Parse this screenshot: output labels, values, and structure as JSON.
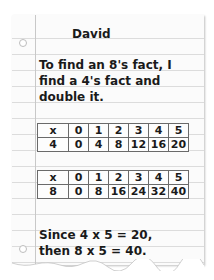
{
  "name": "David",
  "intro": "To find an 8's fact, I find a 4's fact and double it.",
  "table_4": {
    "header": [
      "x",
      "0",
      "1",
      "2",
      "3",
      "4",
      "5"
    ],
    "row": [
      "4",
      "0",
      "4",
      "8",
      "12",
      "16",
      "20"
    ]
  },
  "table_8": {
    "header": [
      "x",
      "0",
      "1",
      "2",
      "3",
      "4",
      "5"
    ],
    "row": [
      "8",
      "0",
      "8",
      "16",
      "24",
      "32",
      "40"
    ]
  },
  "conclusion_line1": "Since 4 x 5 = 20,",
  "conclusion_line2": "then 8 x 5 = 40.",
  "colors": {
    "paper": "#fbfbfb",
    "rule": "#dcdcdc",
    "ink": "#1a1a1a"
  }
}
